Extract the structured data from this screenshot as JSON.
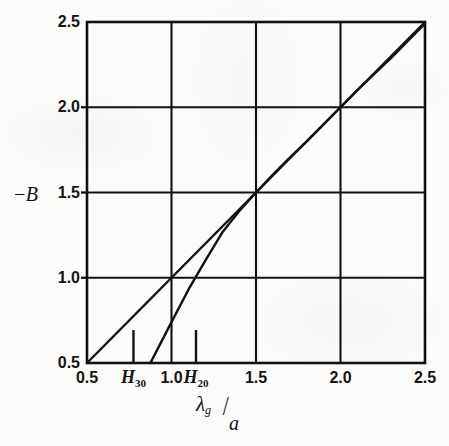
{
  "chart_data": {
    "type": "line",
    "title": "",
    "subtitle": "",
    "xlabel": "λg/a",
    "xlabel_numerator": "λ",
    "xlabel_numerator_sub": "g",
    "xlabel_slash": "/",
    "xlabel_denominator": "a",
    "ylabel": "−B",
    "ylabel_minus": "−",
    "ylabel_symbol": "B",
    "xlim": [
      0.5,
      2.5
    ],
    "ylim": [
      0.5,
      2.5
    ],
    "xticks": [
      0.5,
      1.0,
      1.5,
      2.0,
      2.5
    ],
    "yticks": [
      0.5,
      1.0,
      1.5,
      2.0,
      2.5
    ],
    "xticklabels": [
      "0.5",
      "1.0",
      "1.5",
      "2.0",
      "2.5"
    ],
    "yticklabels": [
      "0.5",
      "1.0",
      "1.5",
      "2.0",
      "2.5"
    ],
    "grid": true,
    "grid_color": "#111111",
    "legend": "none",
    "line_color": "#111111",
    "annotations": [
      {
        "name": "H30",
        "label_main": "H",
        "label_sub": "30",
        "x": 0.775,
        "marker": "vertical-tick"
      },
      {
        "name": "H20",
        "label_main": "H",
        "label_sub": "20",
        "x": 1.145,
        "marker": "vertical-tick"
      }
    ],
    "series": [
      {
        "name": "identity-line",
        "note": "straight diagonal, -B equals lambda_g/a",
        "points": [
          [
            0.5,
            0.5
          ],
          [
            1.0,
            1.0
          ],
          [
            1.5,
            1.5
          ],
          [
            2.0,
            2.0
          ],
          [
            2.5,
            2.5
          ]
        ]
      },
      {
        "name": "lower-curve",
        "note": "rises from the baseline near 0.88 and merges with the diagonal at the top right",
        "points": [
          [
            0.875,
            0.5
          ],
          [
            1.0,
            0.74
          ],
          [
            1.1,
            0.93
          ],
          [
            1.2,
            1.1
          ],
          [
            1.3,
            1.265
          ],
          [
            1.4,
            1.39
          ],
          [
            1.5,
            1.5
          ],
          [
            1.6,
            1.605
          ],
          [
            1.7,
            1.705
          ],
          [
            1.8,
            1.8
          ],
          [
            1.9,
            1.9
          ],
          [
            2.0,
            2.0
          ],
          [
            2.1,
            2.1
          ],
          [
            2.2,
            2.195
          ],
          [
            2.3,
            2.29
          ],
          [
            2.4,
            2.39
          ],
          [
            2.5,
            2.49
          ]
        ]
      }
    ]
  },
  "figure": {
    "background": "#fbfbfa",
    "ink": "#111111"
  }
}
